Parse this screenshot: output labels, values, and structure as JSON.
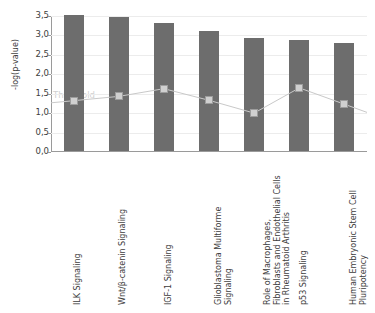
{
  "chart_data": {
    "type": "bar",
    "title": "",
    "subtitle": "",
    "xlabel": "",
    "ylabel": "-log(p-value)",
    "ylim": [
      0.0,
      3.5
    ],
    "ytick_labels": [
      "0,0",
      "0,5",
      "1,0",
      "1,5",
      "2,0",
      "2,5",
      "3,0",
      "3,5"
    ],
    "ytick_values": [
      0.0,
      0.5,
      1.0,
      1.5,
      2.0,
      2.5,
      3.0,
      3.5
    ],
    "grid": true,
    "legend": "none",
    "categories": [
      "ILK Signaling",
      "Wnt/β-catenin Signaling",
      "IGF-1 Signaling",
      "Glioblastoma Multiforme\nSignaling",
      "Role of Macrophages,\nFibroblasts and Endothelial Cells\nin Rheumatoid Arthritis",
      "p53 Signaling",
      "Human Embryonic Stem Cell\nPluripotency"
    ],
    "series": [
      {
        "name": "-log(p-value)",
        "type": "bar",
        "color": "#6d6d6d",
        "values": [
          3.5,
          3.44,
          3.29,
          3.08,
          2.9,
          2.85,
          2.79
        ]
      },
      {
        "name": "Threshold",
        "type": "line",
        "color": "#c9c9c9",
        "marker": "square",
        "values": [
          1.32,
          1.43,
          1.63,
          1.33,
          1.0,
          1.65,
          1.23
        ]
      }
    ],
    "annotations": [
      {
        "text": "Threshold",
        "x_category": "ILK Signaling",
        "y": 1.45,
        "color": "#cfcfcf"
      }
    ]
  },
  "axes": {
    "y_title": "-log(p-value)"
  }
}
